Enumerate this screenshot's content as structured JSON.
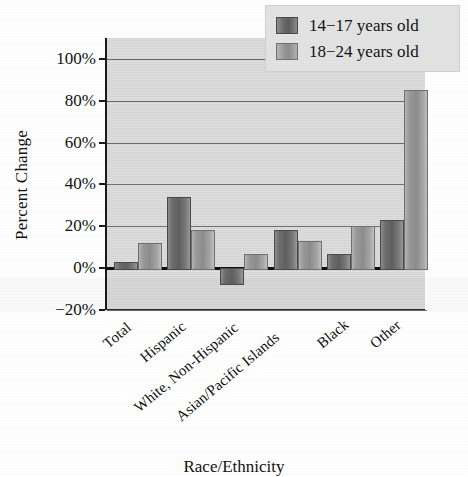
{
  "chart_data": {
    "type": "bar",
    "title": "",
    "xlabel": "Race/Ethnicity",
    "ylabel": "Percent Change",
    "categories": [
      "Total",
      "Hispanic",
      "White, Non-Hispanic",
      "Asian/Pacific Islands",
      "Black",
      "Other"
    ],
    "series": [
      {
        "name": "14−17 years old",
        "values": [
          3,
          34,
          -7,
          18,
          7,
          23
        ],
        "color": "#6e6e6e"
      },
      {
        "name": "18−24 years old",
        "values": [
          12,
          18,
          7,
          13,
          20,
          85
        ],
        "color": "#9a9a9a"
      }
    ],
    "ylim": [
      -20,
      110
    ],
    "yticks": [
      100,
      80,
      60,
      40,
      20,
      0,
      -20
    ],
    "ytick_labels": [
      "100%",
      "80%",
      "60%",
      "40%",
      "20%",
      "0%",
      "−20%"
    ],
    "grid": true,
    "grid_axis": "y",
    "legend_position": "top-right",
    "zero_line": true,
    "plot_background": "#d9d9d9"
  },
  "legend": {
    "entries": [
      {
        "label": "14−17 years old"
      },
      {
        "label": "18−24 years old"
      }
    ]
  },
  "axes": {
    "y_title": "Percent Change",
    "x_title": "Race/Ethnicity"
  }
}
